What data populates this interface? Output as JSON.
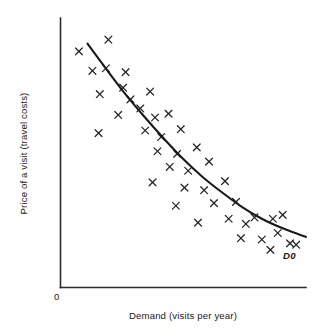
{
  "chart_data": {
    "type": "scatter",
    "title": "",
    "xlabel": "Demand (visits per year)",
    "ylabel": "Price of a visit (travel costs)",
    "origin_label": "0",
    "curve_label": "D0",
    "curve_label_description": "Demand curve D0 fitted through the scatter of observations",
    "axes": {
      "x_axis_shown": true,
      "y_axis_shown": true,
      "grid": false,
      "tick_labels_x": [],
      "tick_labels_y": [],
      "xlim": [
        0,
        100
      ],
      "ylim": [
        0,
        100
      ],
      "axis_color": "#2b2b2b"
    },
    "legend": {
      "shown": false,
      "position": "none",
      "entries": []
    },
    "series": [
      {
        "name": "Observations",
        "marker": "x",
        "color": "#242424",
        "points": [
          [
            7.5,
            91.0
          ],
          [
            19.5,
            95.5
          ],
          [
            13.0,
            83.5
          ],
          [
            18.5,
            84.5
          ],
          [
            26.5,
            83.0
          ],
          [
            16.0,
            74.5
          ],
          [
            25.5,
            77.0
          ],
          [
            28.5,
            72.5
          ],
          [
            36.5,
            75.5
          ],
          [
            23.5,
            66.5
          ],
          [
            32.5,
            69.0
          ],
          [
            38.5,
            65.5
          ],
          [
            44.0,
            67.0
          ],
          [
            15.5,
            59.5
          ],
          [
            34.5,
            60.5
          ],
          [
            41.0,
            58.0
          ],
          [
            49.0,
            61.0
          ],
          [
            39.5,
            52.5
          ],
          [
            47.5,
            51.5
          ],
          [
            55.5,
            54.0
          ],
          [
            44.5,
            46.5
          ],
          [
            52.0,
            45.0
          ],
          [
            60.5,
            48.5
          ],
          [
            37.5,
            40.5
          ],
          [
            50.5,
            38.5
          ],
          [
            58.5,
            37.5
          ],
          [
            67.0,
            41.0
          ],
          [
            47.0,
            31.5
          ],
          [
            62.5,
            32.5
          ],
          [
            71.5,
            33.0
          ],
          [
            56.0,
            25.0
          ],
          [
            68.5,
            26.5
          ],
          [
            75.5,
            24.5
          ],
          [
            79.0,
            27.0
          ],
          [
            86.5,
            26.5
          ],
          [
            90.5,
            28.0
          ],
          [
            73.5,
            19.0
          ],
          [
            82.0,
            18.5
          ],
          [
            88.5,
            21.0
          ],
          [
            93.5,
            17.0
          ],
          [
            85.5,
            14.5
          ],
          [
            96.0,
            16.5
          ]
        ]
      }
    ],
    "fitted_curve": {
      "name": "D0",
      "shape": "downward-sloping convex demand curve",
      "color": "#1a1a1a",
      "points": [
        [
          11.0,
          94.0
        ],
        [
          18.0,
          85.0
        ],
        [
          26.0,
          75.0
        ],
        [
          34.0,
          66.0
        ],
        [
          42.0,
          57.5
        ],
        [
          50.0,
          49.5
        ],
        [
          58.0,
          42.5
        ],
        [
          66.0,
          36.5
        ],
        [
          74.0,
          31.0
        ],
        [
          82.0,
          26.5
        ],
        [
          90.0,
          23.0
        ],
        [
          97.0,
          20.5
        ],
        [
          100.0,
          19.5
        ]
      ]
    }
  }
}
